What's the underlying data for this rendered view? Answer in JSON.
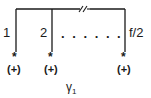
{
  "diagram": {
    "legs": [
      {
        "label": "1",
        "charge": "(+)",
        "marker": "*"
      },
      {
        "label": "2",
        "charge": "(+)",
        "marker": "*"
      },
      {
        "label": "f/2",
        "charge": "(+)",
        "marker": "*"
      }
    ],
    "ellipsis": ". . . . . .",
    "break_mark": "//",
    "caption": {
      "symbol": "γ",
      "subscript": "1"
    }
  }
}
